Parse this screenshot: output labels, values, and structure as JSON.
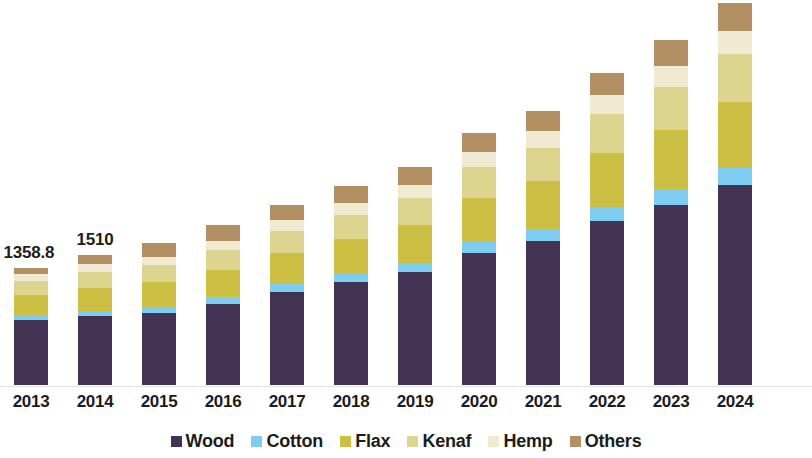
{
  "chart_data": {
    "type": "bar",
    "subtype": "stacked-column",
    "title": "",
    "subtitle": "",
    "xlabel": "",
    "ylabel": "",
    "grid": false,
    "axis_visible": {
      "x": true,
      "y": false
    },
    "ylim": [
      0,
      4600
    ],
    "legend_position": "bottom",
    "categories": [
      "2013",
      "2014",
      "2015",
      "2016",
      "2017",
      "2018",
      "2019",
      "2020",
      "2021",
      "2022",
      "2023",
      "2024"
    ],
    "series": [
      {
        "name": "Wood",
        "color": "#413351",
        "values": [
          756.0,
          800.0,
          836.0,
          940.0,
          1080.0,
          1195.0,
          1310.0,
          1530.0,
          1670.0,
          1905.0,
          2090.0,
          2320.0
        ]
      },
      {
        "name": "Cotton",
        "color": "#7ecdf0",
        "values": [
          58.0,
          64.0,
          70.0,
          78.0,
          88.0,
          98.0,
          108.0,
          128.0,
          140.0,
          162.0,
          180.0,
          200.0
        ]
      },
      {
        "name": "Flax",
        "color": "#cdbe44",
        "values": [
          232.0,
          260.0,
          285.0,
          320.0,
          360.0,
          400.0,
          440.0,
          510.0,
          555.0,
          630.0,
          695.0,
          770.0
        ]
      },
      {
        "name": "Kenaf",
        "color": "#ddd58f",
        "values": [
          162.0,
          184.0,
          200.0,
          226.0,
          255.0,
          282.0,
          310.0,
          360.0,
          392.0,
          448.0,
          495.0,
          548.0
        ]
      },
      {
        "name": "Hemp",
        "color": "#f0ead2",
        "values": [
          81.0,
          92.0,
          101.0,
          113.0,
          127.0,
          141.0,
          155.0,
          180.0,
          196.0,
          224.0,
          247.0,
          274.0
        ]
      },
      {
        "name": "Others",
        "color": "#b39063",
        "values": [
          69.8,
          110.0,
          156.0,
          180.0,
          180.0,
          194.0,
          207.0,
          217.0,
          227.0,
          253.0,
          298.0,
          322.0
        ]
      }
    ],
    "totals": [
      1358.8,
      1510.0,
      1648.0,
      1857.0,
      2090.0,
      2310.0,
      2530.0,
      2925.0,
      3180.0,
      3622.0,
      4005.0,
      4434.0
    ],
    "data_labels": [
      {
        "category": "2013",
        "text": "1358.8"
      },
      {
        "category": "2014",
        "text": "1510"
      }
    ],
    "legend": [
      {
        "label": "Wood",
        "color": "#413351"
      },
      {
        "label": "Cotton",
        "color": "#7ecdf0"
      },
      {
        "label": "Flax",
        "color": "#cdbe44"
      },
      {
        "label": "Kenaf",
        "color": "#ddd58f"
      },
      {
        "label": "Hemp",
        "color": "#f0ead2"
      },
      {
        "label": "Others",
        "color": "#b39063"
      }
    ],
    "layout": {
      "plot_height_px": 382,
      "baseline_y_px": 385,
      "bar_width_px": 34,
      "bar_pitch_px": 64,
      "first_bar_left_px": 14,
      "value_per_px": 11.607
    },
    "colors": {
      "background": "#ffffff",
      "text": "#1c1c1c",
      "axis": "#e3e3e3"
    }
  }
}
